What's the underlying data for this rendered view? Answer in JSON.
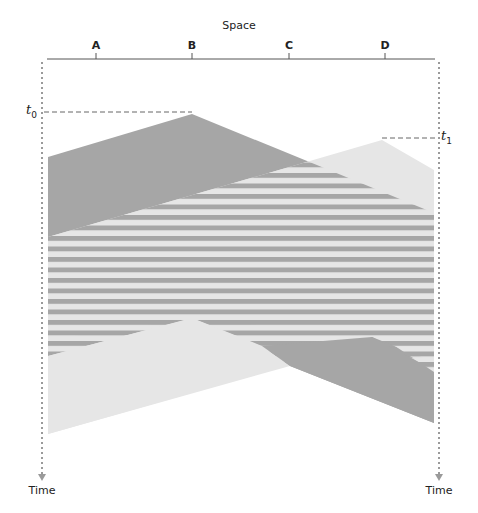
{
  "diagram": {
    "axis_title": "Space",
    "positions": [
      {
        "label": "A",
        "x": 96
      },
      {
        "label": "B",
        "x": 192
      },
      {
        "label": "C",
        "x": 289
      },
      {
        "label": "D",
        "x": 385
      }
    ],
    "time_label_left": "Time",
    "time_label_right": "Time",
    "events": [
      {
        "symbol": "t",
        "subscript": "0",
        "at": "B"
      },
      {
        "symbol": "t",
        "subscript": "1",
        "at": "D"
      }
    ],
    "colors": {
      "dark_fill": "#a6a6a6",
      "light_fill": "#e6e6e6",
      "stripe_dark": "#a6a6a6",
      "stripe_light": "#e6e6e6",
      "axis": "#555555",
      "dotted": "#9a9a9a"
    },
    "legend": []
  }
}
